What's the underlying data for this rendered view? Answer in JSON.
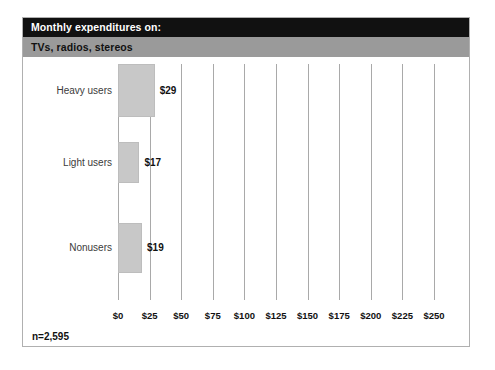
{
  "chart_data": {
    "type": "bar",
    "orientation": "horizontal",
    "title": "Monthly expenditures on:",
    "subtitle": "TVs, radios, stereos",
    "categories": [
      "Heavy users",
      "Light users",
      "Nonusers"
    ],
    "values": [
      29,
      19,
      17
    ],
    "series": [
      {
        "name": "Monthly expenditure",
        "values": [
          29,
          17,
          19
        ]
      }
    ],
    "bars": [
      {
        "label": "Heavy users",
        "value": 29,
        "value_label": "$29"
      },
      {
        "label": "Light users",
        "value": 17,
        "value_label": "$17"
      },
      {
        "label": "Nonusers",
        "value": 19,
        "value_label": "$19"
      }
    ],
    "xlabel": "",
    "ylabel": "",
    "xlim": [
      0,
      250
    ],
    "xtick_step": 25,
    "xtick_labels": [
      "$0",
      "$25",
      "$50",
      "$75",
      "$100",
      "$125",
      "$150",
      "$175",
      "$200",
      "$225",
      "$250"
    ],
    "xtick_values": [
      0,
      25,
      50,
      75,
      100,
      125,
      150,
      175,
      200,
      225,
      250
    ],
    "grid": "vertical",
    "legend": "none",
    "footnote": "n=2,595",
    "sample_size": 2595,
    "colors": {
      "title_band": "#111111",
      "title_text": "#ffffff",
      "subtitle_band": "#9a9a9a",
      "subtitle_text": "#111111",
      "bar_fill": "#c8c8c8",
      "gridline": "#a9a9a9",
      "frame_border": "#b0b0b0",
      "background": "#ffffff"
    }
  }
}
